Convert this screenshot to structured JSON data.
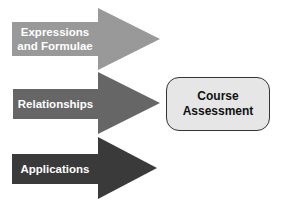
{
  "diagram": {
    "arrows": [
      {
        "id": "expressions",
        "lines": [
          "Expressions",
          "and Formulae"
        ],
        "color": "#999999"
      },
      {
        "id": "relationships",
        "lines": [
          "Relationships"
        ],
        "color": "#666666"
      },
      {
        "id": "applications",
        "lines": [
          "Applications"
        ],
        "color": "#3a3a3a"
      }
    ],
    "target": {
      "lines": [
        "Course",
        "Assessment"
      ],
      "fill": "#e6e6e6",
      "border": "#333333"
    }
  }
}
